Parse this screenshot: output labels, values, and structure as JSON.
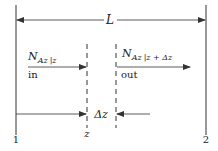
{
  "diagram": {
    "length_label": "L",
    "flux_in": {
      "symbol": "N",
      "subscript": "Az",
      "eval": "|z",
      "label": "in"
    },
    "flux_out": {
      "symbol": "N",
      "subscript": "Az",
      "eval": "|z + Δz",
      "label": "out"
    },
    "delta_label": "Δz",
    "z_label": "z",
    "boundary_left": "1",
    "boundary_right": "2",
    "colors": {
      "line": "#333333",
      "background": "#ffffff"
    }
  }
}
